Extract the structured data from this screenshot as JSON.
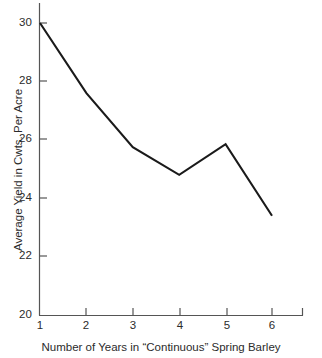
{
  "chart_data": {
    "type": "line",
    "title": "",
    "xlabel": "Number of Years in “Continuous” Spring Barley",
    "ylabel": "Average Yield in Cwts. Per Acre",
    "x": [
      1,
      2,
      3,
      4,
      5,
      6
    ],
    "values": [
      30.0,
      27.6,
      25.75,
      24.8,
      25.85,
      23.4
    ],
    "series": [
      {
        "name": "Average Yield",
        "values": [
          30.0,
          27.6,
          25.75,
          24.8,
          25.85,
          23.4
        ]
      }
    ],
    "xlim": [
      1,
      6
    ],
    "ylim": [
      20,
      30
    ],
    "xticks": [
      1,
      2,
      3,
      4,
      5,
      6
    ],
    "yticks": [
      20,
      22,
      24,
      26,
      28,
      30
    ],
    "xtick_labels": [
      "1",
      "2",
      "3",
      "4",
      "5",
      "6"
    ],
    "ytick_labels": [
      "20",
      "22",
      "24",
      "26",
      "28",
      "30"
    ],
    "grid": false,
    "legend": false,
    "legend_position": "none",
    "line_color": "#1a1a1a",
    "axis_color": "#555555",
    "background_color": "#ffffff",
    "annotations": []
  },
  "axes": {
    "y_ticks": [
      {
        "label": "30"
      },
      {
        "label": "28"
      },
      {
        "label": "26"
      },
      {
        "label": "24"
      },
      {
        "label": "22"
      },
      {
        "label": "20"
      }
    ],
    "x_ticks": [
      {
        "label": "1"
      },
      {
        "label": "2"
      },
      {
        "label": "3"
      },
      {
        "label": "4"
      },
      {
        "label": "5"
      },
      {
        "label": "6"
      }
    ],
    "x_axis_title": "Number of Years in “Continuous” Spring Barley",
    "y_axis_title": "Average Yield in Cwts. Per Acre"
  }
}
